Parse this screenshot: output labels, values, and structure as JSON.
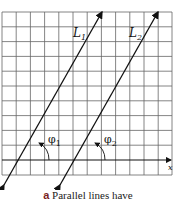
{
  "figure": {
    "lines": [
      {
        "label": "L",
        "subscript": "1",
        "angle_label": "φ",
        "angle_subscript": "1"
      },
      {
        "label": "L",
        "subscript": "2",
        "angle_label": "φ",
        "angle_subscript": "2"
      }
    ],
    "axis_label": "x",
    "grid": {
      "columns": 12,
      "rows": 11
    }
  },
  "caption": {
    "letter": "a",
    "text": "Parallel lines have"
  },
  "colors": {
    "line": "#111111",
    "grid": "#555555",
    "caption_letter": "#7a1f1f"
  }
}
